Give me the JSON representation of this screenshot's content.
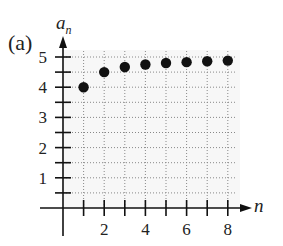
{
  "panel_label": "(a)",
  "chart_data": {
    "type": "scatter",
    "title": "",
    "xlabel": "n",
    "ylabel": "a_n",
    "ylabel_base": "a",
    "ylabel_sub": "n",
    "xlim": [
      0,
      8
    ],
    "ylim": [
      0,
      5
    ],
    "x_ticks": [
      1,
      2,
      3,
      4,
      5,
      6,
      7,
      8
    ],
    "x_tick_labels": [
      "2",
      "4",
      "6",
      "8"
    ],
    "x_tick_label_values": [
      2,
      4,
      6,
      8
    ],
    "y_ticks": [
      0.5,
      1,
      1.5,
      2,
      2.5,
      3,
      3.5,
      4,
      4.5,
      5
    ],
    "y_tick_labels": [
      "1",
      "2",
      "3",
      "4",
      "5"
    ],
    "y_tick_label_values": [
      1,
      2,
      3,
      4,
      5
    ],
    "grid": true,
    "grid_style": "dotted",
    "series": [
      {
        "name": "a_n",
        "x": [
          1,
          2,
          3,
          4,
          5,
          6,
          7,
          8
        ],
        "y": [
          4,
          4.5,
          4.67,
          4.75,
          4.8,
          4.83,
          4.86,
          4.88
        ],
        "marker": "filled-circle",
        "color": "#111111"
      }
    ]
  }
}
